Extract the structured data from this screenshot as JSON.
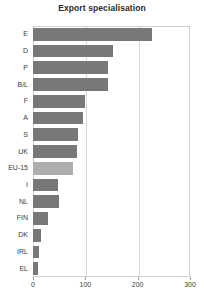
{
  "chart_data": {
    "type": "bar",
    "orientation": "horizontal",
    "title": "Export specialisation",
    "xlabel": "",
    "ylabel": "",
    "categories": [
      "E",
      "D",
      "P",
      "B/L",
      "F",
      "A",
      "S",
      "UK",
      "EU-15",
      "I",
      "NL",
      "FIN",
      "DK",
      "IRL",
      "EL"
    ],
    "values": [
      227,
      153,
      143,
      143,
      99,
      96,
      86,
      84,
      76,
      48,
      50,
      29,
      15,
      11,
      9
    ],
    "xlim": [
      0,
      300
    ],
    "xticks": [
      0,
      100,
      200,
      300
    ],
    "xtick_labels": [
      "0",
      "100",
      "200",
      "300"
    ],
    "grid": true,
    "grid_axis": "x",
    "legend": false,
    "bar_color": "#787878",
    "highlight_color": "#aeaeae",
    "highlight_category": "EU-15",
    "plot_border_color": "#cfcfcf",
    "gridline_color": "#d8d8d8",
    "background_color": "#ffffff"
  }
}
